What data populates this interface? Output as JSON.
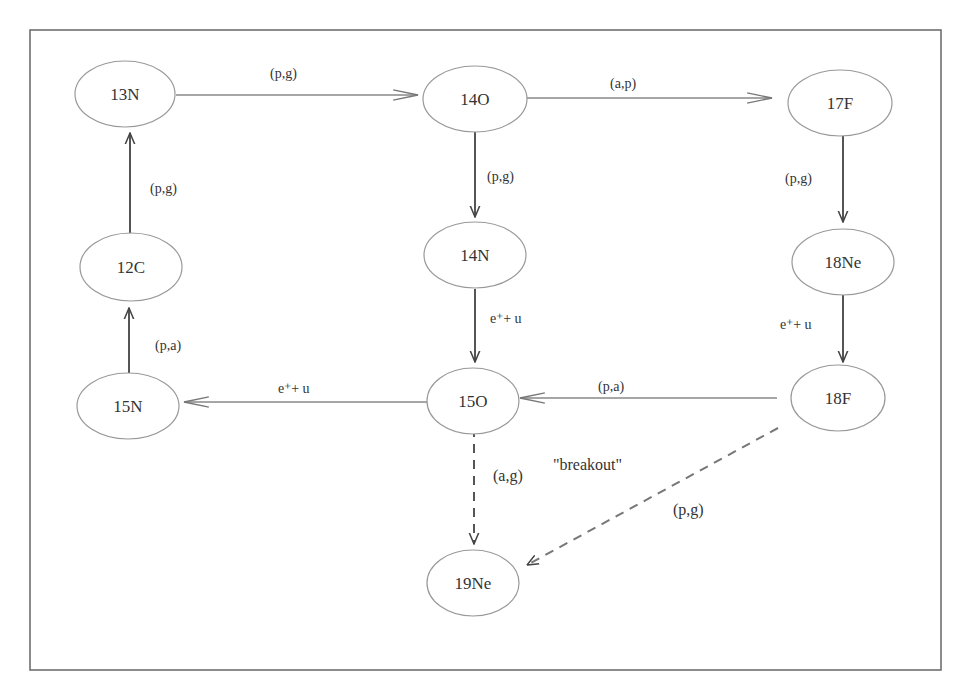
{
  "diagram": {
    "nodes": [
      {
        "id": "13N",
        "label": "13N"
      },
      {
        "id": "14O",
        "label": "14O"
      },
      {
        "id": "17F",
        "label": "17F"
      },
      {
        "id": "12C",
        "label": "12C"
      },
      {
        "id": "14N",
        "label": "14N"
      },
      {
        "id": "18Ne",
        "label": "18Ne"
      },
      {
        "id": "15N",
        "label": "15N"
      },
      {
        "id": "15O",
        "label": "15O"
      },
      {
        "id": "18F",
        "label": "18F"
      },
      {
        "id": "19Ne",
        "label": "19Ne"
      }
    ],
    "edges": [
      {
        "from": "13N",
        "to": "14O",
        "label": "(p,g)",
        "style": "solid"
      },
      {
        "from": "14O",
        "to": "17F",
        "label": "(a,p)",
        "style": "solid"
      },
      {
        "from": "12C",
        "to": "13N",
        "label": "(p,g)",
        "style": "solid"
      },
      {
        "from": "14O",
        "to": "14N",
        "label": "(p,g)",
        "style": "solid"
      },
      {
        "from": "17F",
        "to": "18Ne",
        "label": "(p,g)",
        "style": "solid"
      },
      {
        "from": "15N",
        "to": "12C",
        "label": "(p,a)",
        "style": "solid"
      },
      {
        "from": "14N",
        "to": "15O",
        "label": "e⁺+ u",
        "style": "solid"
      },
      {
        "from": "18Ne",
        "to": "18F",
        "label": "e⁺+ u",
        "style": "solid"
      },
      {
        "from": "15O",
        "to": "15N",
        "label": "e⁺+ u",
        "style": "solid"
      },
      {
        "from": "18F",
        "to": "15O",
        "label": "(p,a)",
        "style": "solid"
      },
      {
        "from": "15O",
        "to": "19Ne",
        "label": "(a,g)",
        "style": "dashed"
      },
      {
        "from": "18F",
        "to": "19Ne",
        "label": "(p,g)",
        "style": "dashed"
      }
    ],
    "annotations": [
      {
        "text": "\"breakout\""
      }
    ]
  }
}
